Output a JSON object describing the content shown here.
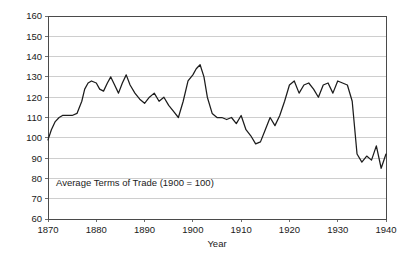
{
  "chart_data": {
    "type": "line",
    "title": "",
    "subtitle": "",
    "annotation": "Average Terms of Trade (1900 = 100)",
    "xlabel": "Year",
    "ylabel": "",
    "xlim": [
      1870,
      1940
    ],
    "ylim": [
      60,
      160
    ],
    "xticks": [
      1870,
      1880,
      1890,
      1900,
      1910,
      1920,
      1930,
      1940
    ],
    "xticklabels": [
      "1870",
      "1880",
      "1890",
      "1900",
      "1910",
      "1920",
      "1930",
      "1940"
    ],
    "yticks": [
      60,
      70,
      80,
      90,
      100,
      110,
      120,
      130,
      140,
      150,
      160
    ],
    "yticklabels": [
      "60",
      "70",
      "80",
      "90",
      "100",
      "110",
      "120",
      "130",
      "140",
      "150",
      "160"
    ],
    "grid": "horizontal",
    "legend": "none",
    "line_color": "#1c1c1c",
    "grid_color": "#b9b9b9",
    "frame_color": "#4a4a4a",
    "series": [
      {
        "name": "Average Terms of Trade",
        "x": [
          1870,
          1871,
          1872,
          1873,
          1874,
          1875,
          1876,
          1877,
          1878,
          1879,
          1880,
          1881,
          1882,
          1883,
          1884,
          1885,
          1886,
          1887,
          1888,
          1889,
          1890,
          1891,
          1892,
          1893,
          1894,
          1895,
          1896,
          1897,
          1898,
          1899,
          1900,
          1901,
          1902,
          1903,
          1904,
          1905,
          1906,
          1907,
          1908,
          1909,
          1910,
          1911,
          1912,
          1913,
          1914,
          1915,
          1916,
          1917,
          1918,
          1919,
          1920,
          1921,
          1922,
          1923,
          1924,
          1925,
          1926,
          1927,
          1928,
          1929,
          1930,
          1931,
          1932,
          1933,
          1934,
          1935,
          1936,
          1937,
          1938,
          1939,
          1940
        ],
        "values": [
          99,
          106,
          109,
          110,
          110,
          111,
          111,
          111,
          117,
          124,
          127,
          127,
          126,
          123,
          125,
          129,
          130,
          126,
          124,
          121,
          117,
          120,
          121,
          117,
          119,
          115,
          112,
          117,
          130,
          133,
          136,
          129,
          120,
          112,
          109,
          109,
          108,
          110,
          107,
          112,
          104,
          100,
          96,
          96,
          104,
          110,
          105,
          110,
          127,
          128,
          122,
          126,
          127,
          124,
          120,
          126,
          127,
          120,
          128,
          132,
          135,
          125,
          105,
          98,
          98,
          106,
          110,
          110,
          109,
          108,
          103
        ]
      }
    ]
  },
  "series_render": {
    "x": [
      1870,
      1870.7,
      1871.5,
      1872.3,
      1873,
      1874,
      1875,
      1876,
      1877,
      1877.6,
      1878.3,
      1879,
      1880,
      1880.7,
      1881.5,
      1882.3,
      1883,
      1883.8,
      1884.6,
      1885.4,
      1886.2,
      1887,
      1888,
      1889,
      1890,
      1891,
      1892,
      1893,
      1894,
      1895,
      1896,
      1897,
      1898,
      1899,
      1900,
      1900.7,
      1901.5,
      1902.3,
      1903,
      1904,
      1905,
      1906,
      1907,
      1908,
      1909,
      1910,
      1911,
      1912,
      1913,
      1914,
      1915,
      1916,
      1917,
      1918,
      1919,
      1920,
      1921,
      1922,
      1923,
      1924,
      1925,
      1926,
      1927,
      1928,
      1929,
      1930,
      1931,
      1932,
      1933,
      1934,
      1935,
      1936,
      1937,
      1938,
      1939,
      1940
    ],
    "values": [
      99,
      104,
      108,
      110,
      111,
      111,
      111,
      112,
      118,
      124,
      127,
      128,
      127,
      124,
      123,
      127,
      130,
      126,
      122,
      127,
      131,
      126,
      122,
      119,
      117,
      120,
      122,
      118,
      120,
      116,
      113,
      110,
      118,
      128,
      131,
      134,
      136,
      130,
      120,
      112,
      110,
      110,
      109,
      110,
      107,
      111,
      104,
      101,
      97,
      98,
      104,
      110,
      106,
      111,
      118,
      126,
      128,
      122,
      126,
      127,
      124,
      120,
      126,
      127,
      122,
      128,
      127,
      126,
      118,
      92,
      88,
      91,
      89,
      96,
      85,
      92
    ]
  },
  "geometry": {
    "plot_left": 48,
    "plot_right": 386,
    "plot_top": 16,
    "plot_bottom": 219
  }
}
